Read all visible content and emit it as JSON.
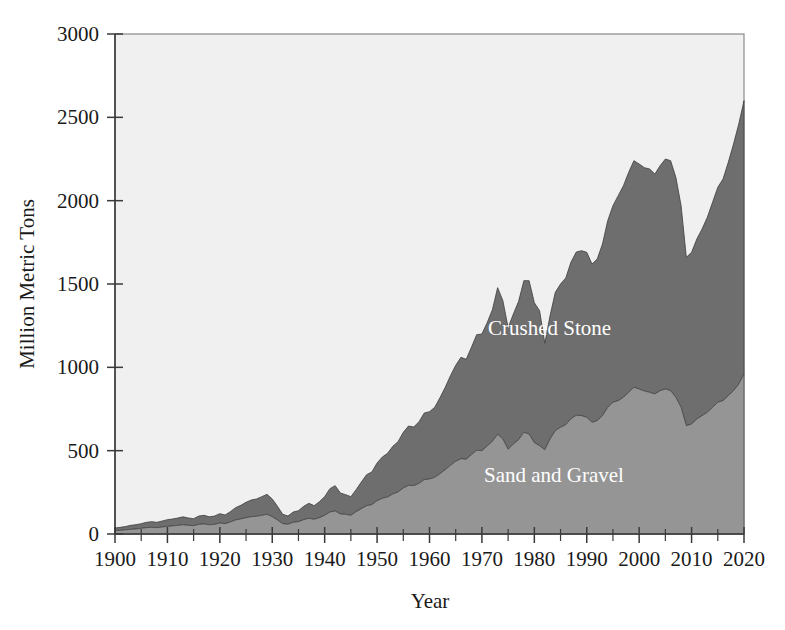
{
  "figure": {
    "background_color": "#ffffff",
    "plot_background_color": "#f0f0f0",
    "plot_border_color": "#8a8a8a"
  },
  "chart_data": {
    "type": "area",
    "stacked": true,
    "title": "",
    "subtitle": "",
    "xlabel": "Year",
    "ylabel": "Million Metric Tons",
    "xlim": [
      1900,
      2020
    ],
    "ylim": [
      0,
      3000
    ],
    "ytick_values": [
      0,
      500,
      1000,
      1500,
      2000,
      2500,
      3000
    ],
    "ytick_labels": [
      "0",
      "500",
      "1000",
      "1500",
      "2000",
      "2500",
      "3000"
    ],
    "xtick_values": [
      1900,
      1910,
      1920,
      1930,
      1940,
      1950,
      1960,
      1970,
      1980,
      1990,
      2000,
      2010,
      2020
    ],
    "xtick_labels": [
      "1900",
      "1910",
      "1920",
      "1930",
      "1940",
      "1950",
      "1960",
      "1970",
      "1980",
      "1990",
      "2000",
      "2010",
      "2020"
    ],
    "xtick_minor_step": 5,
    "grid": false,
    "legend_position": "inline-annotation",
    "x": [
      1900,
      1901,
      1902,
      1903,
      1904,
      1905,
      1906,
      1907,
      1908,
      1909,
      1910,
      1911,
      1912,
      1913,
      1914,
      1915,
      1916,
      1917,
      1918,
      1919,
      1920,
      1921,
      1922,
      1923,
      1924,
      1925,
      1926,
      1927,
      1928,
      1929,
      1930,
      1931,
      1932,
      1933,
      1934,
      1935,
      1936,
      1937,
      1938,
      1939,
      1940,
      1941,
      1942,
      1943,
      1944,
      1945,
      1946,
      1947,
      1948,
      1949,
      1950,
      1951,
      1952,
      1953,
      1954,
      1955,
      1956,
      1957,
      1958,
      1959,
      1960,
      1961,
      1962,
      1963,
      1964,
      1965,
      1966,
      1967,
      1968,
      1969,
      1970,
      1971,
      1972,
      1973,
      1974,
      1975,
      1976,
      1977,
      1978,
      1979,
      1980,
      1981,
      1982,
      1983,
      1984,
      1985,
      1986,
      1987,
      1988,
      1989,
      1990,
      1991,
      1992,
      1993,
      1994,
      1995,
      1996,
      1997,
      1998,
      1999,
      2000,
      2001,
      2002,
      2003,
      2004,
      2005,
      2006,
      2007,
      2008,
      2009,
      2010,
      2011,
      2012,
      2013,
      2014,
      2015,
      2016,
      2017,
      2018,
      2019,
      2020
    ],
    "series": [
      {
        "name": "Sand and Gravel",
        "color": "#959595",
        "label_x": 1975,
        "label_y": 640,
        "values": [
          20,
          22,
          25,
          28,
          30,
          34,
          38,
          40,
          38,
          42,
          46,
          48,
          52,
          55,
          52,
          50,
          58,
          60,
          55,
          58,
          66,
          62,
          72,
          84,
          90,
          98,
          104,
          106,
          112,
          118,
          104,
          84,
          62,
          58,
          70,
          74,
          86,
          94,
          88,
          98,
          112,
          132,
          138,
          120,
          118,
          112,
          134,
          152,
          170,
          176,
          200,
          214,
          222,
          240,
          252,
          276,
          292,
          290,
          304,
          326,
          330,
          340,
          362,
          386,
          412,
          436,
          452,
          448,
          476,
          502,
          500,
          528,
          556,
          598,
          570,
          508,
          540,
          566,
          610,
          600,
          548,
          530,
          505,
          570,
          620,
          640,
          656,
          692,
          712,
          710,
          700,
          670,
          680,
          710,
          760,
          790,
          800,
          820,
          850,
          880,
          870,
          858,
          850,
          840,
          860,
          870,
          860,
          820,
          760,
          650,
          660,
          690,
          710,
          730,
          760,
          790,
          800,
          830,
          860,
          900,
          960
        ]
      },
      {
        "name": "Crushed Stone",
        "color": "#6e6e6e",
        "label_x": 2000,
        "label_y": 1600,
        "values": [
          16,
          18,
          20,
          24,
          26,
          28,
          32,
          34,
          32,
          36,
          40,
          42,
          44,
          48,
          44,
          42,
          50,
          52,
          48,
          50,
          56,
          52,
          62,
          74,
          82,
          92,
          100,
          104,
          112,
          120,
          106,
          82,
          56,
          50,
          62,
          66,
          80,
          90,
          82,
          96,
          112,
          140,
          152,
          126,
          118,
          112,
          132,
          160,
          186,
          196,
          226,
          248,
          262,
          286,
          302,
          334,
          356,
          352,
          370,
          400,
          404,
          420,
          456,
          494,
          538,
          576,
          608,
          600,
          644,
          694,
          700,
          740,
          790,
          880,
          830,
          730,
          780,
          830,
          910,
          920,
          840,
          810,
          640,
          740,
          830,
          860,
          880,
          940,
          980,
          990,
          990,
          950,
          970,
          1030,
          1120,
          1180,
          1230,
          1270,
          1320,
          1360,
          1350,
          1340,
          1340,
          1320,
          1350,
          1380,
          1380,
          1320,
          1210,
          1010,
          1030,
          1080,
          1120,
          1170,
          1230,
          1290,
          1330,
          1400,
          1480,
          1560,
          1640
        ]
      }
    ],
    "notes": {
      "peak_1973_total": 1720,
      "peak_1979_total": 1700,
      "trough_1982_total": 1165,
      "final_2020_total": 2600,
      "final_2020_sand_and_gravel": 960
    }
  },
  "annotations": [
    {
      "name": "crushed-stone-label",
      "text": "Crushed Stone"
    },
    {
      "name": "sand-and-gravel-label",
      "text": "Sand and Gravel"
    }
  ]
}
